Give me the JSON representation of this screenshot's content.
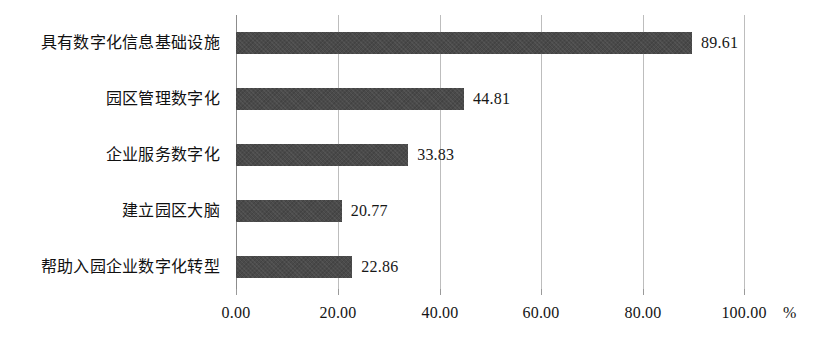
{
  "chart_data": {
    "type": "bar",
    "orientation": "horizontal",
    "title": "",
    "subtitle": "",
    "xlabel": "%",
    "ylabel": "",
    "unit": "%",
    "xlim": [
      0,
      100
    ],
    "grid": true,
    "legend": null,
    "categories": [
      "具有数字化信息基础设施",
      "园区管理数字化",
      "企业服务数字化",
      "建立园区大脑",
      "帮助入园企业数字化转型"
    ],
    "values": [
      89.61,
      44.81,
      33.83,
      20.77,
      22.86
    ],
    "value_labels": [
      "89.61",
      "44.81",
      "33.83",
      "20.77",
      "22.86"
    ],
    "xticks": [
      0,
      20,
      40,
      60,
      80,
      100
    ],
    "xtick_labels": [
      "0.00",
      "20.00",
      "40.00",
      "60.00",
      "80.00",
      "100.00"
    ],
    "bar_color": "#4a4a4a",
    "grid_color": "#bdbdbd",
    "axis_color": "#8c8c8c",
    "background": "#ffffff"
  }
}
